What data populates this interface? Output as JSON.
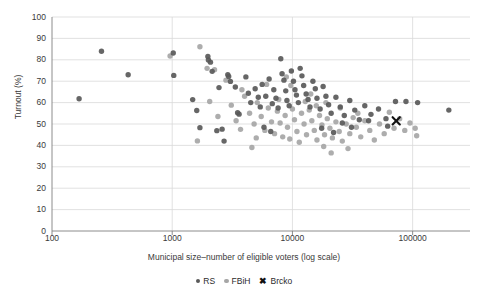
{
  "chart_data": {
    "type": "scatter",
    "title": "",
    "xlabel": "Municipal size–number of eligible voters (log scale)",
    "ylabel": "Turnout (%)",
    "xscale": "log",
    "xlim": [
      100,
      300000
    ],
    "ylim": [
      0,
      100
    ],
    "grid": true,
    "grid_axis": "y",
    "legend_position": "bottom",
    "yticks": [
      0,
      10,
      20,
      30,
      40,
      50,
      60,
      70,
      80,
      90,
      100
    ],
    "xticks": [
      100,
      1000,
      10000,
      100000
    ],
    "xtick_labels": [
      "100",
      "1000",
      "10000",
      "100000"
    ],
    "colors": {
      "RS": "#595959",
      "FBiH": "#a6a6a6",
      "Brcko": "#111111",
      "grid": "#d9d9d9",
      "axis": "#808080",
      "text": "#3a3a3a"
    },
    "series": [
      {
        "name": "RS",
        "marker": "circle",
        "color": "#595959",
        "points": [
          [
            168,
            61.8
          ],
          [
            258,
            84.0
          ],
          [
            430,
            73.0
          ],
          [
            1020,
            83.2
          ],
          [
            1030,
            72.7
          ],
          [
            1480,
            61.4
          ],
          [
            1600,
            56.3
          ],
          [
            1980,
            81.6
          ],
          [
            2000,
            79.9
          ],
          [
            2080,
            78.9
          ],
          [
            2150,
            74.6
          ],
          [
            2450,
            67.0
          ],
          [
            2600,
            47.6
          ],
          [
            2350,
            46.9
          ],
          [
            2900,
            73.0
          ],
          [
            2950,
            72.2
          ],
          [
            3050,
            69.9
          ],
          [
            3350,
            67.3
          ],
          [
            3500,
            55.3
          ],
          [
            3600,
            54.6
          ],
          [
            4100,
            72.0
          ],
          [
            4300,
            64.4
          ],
          [
            4500,
            60.0
          ],
          [
            4900,
            66.5
          ],
          [
            5200,
            62.5
          ],
          [
            5400,
            58.0
          ],
          [
            5600,
            68.5
          ],
          [
            6000,
            63.0
          ],
          [
            6400,
            71.0
          ],
          [
            6800,
            59.5
          ],
          [
            7000,
            66.0
          ],
          [
            7300,
            62.0
          ],
          [
            7600,
            57.5
          ],
          [
            8000,
            80.5
          ],
          [
            8200,
            73.5
          ],
          [
            8500,
            70.5
          ],
          [
            8800,
            65.5
          ],
          [
            9000,
            61.0
          ],
          [
            9400,
            58.5
          ],
          [
            9800,
            74.8
          ],
          [
            10200,
            70.0
          ],
          [
            10500,
            66.0
          ],
          [
            10800,
            63.5
          ],
          [
            11200,
            60.0
          ],
          [
            11600,
            76.0
          ],
          [
            12000,
            72.5
          ],
          [
            12400,
            68.0
          ],
          [
            13000,
            64.0
          ],
          [
            13500,
            61.5
          ],
          [
            14000,
            58.0
          ],
          [
            14800,
            70.0
          ],
          [
            15500,
            66.5
          ],
          [
            16000,
            62.0
          ],
          [
            17000,
            57.0
          ],
          [
            18000,
            67.5
          ],
          [
            19000,
            63.0
          ],
          [
            20000,
            59.0
          ],
          [
            21000,
            55.0
          ],
          [
            23000,
            62.5
          ],
          [
            25000,
            58.0
          ],
          [
            27000,
            54.0
          ],
          [
            30000,
            61.0
          ],
          [
            33000,
            56.5
          ],
          [
            36000,
            52.0
          ],
          [
            40000,
            58.5
          ],
          [
            45000,
            54.5
          ],
          [
            52000,
            57.0
          ],
          [
            60000,
            52.5
          ],
          [
            72000,
            60.5
          ],
          [
            88000,
            60.5
          ],
          [
            110000,
            60.0
          ],
          [
            200000,
            56.5
          ],
          [
            5800,
            48.5
          ],
          [
            6600,
            46.5
          ],
          [
            2700,
            42.0
          ],
          [
            17500,
            48.0
          ],
          [
            22000,
            46.0
          ],
          [
            26000,
            50.5
          ],
          [
            31000,
            48.5
          ],
          [
            43000,
            51.5
          ],
          [
            62000,
            49.0
          ],
          [
            1700,
            48.3
          ]
        ]
      },
      {
        "name": "FBiH",
        "marker": "circle",
        "color": "#a6a6a6",
        "points": [
          [
            960,
            81.8
          ],
          [
            1700,
            86.1
          ],
          [
            1620,
            42.1
          ],
          [
            1950,
            76.0
          ],
          [
            2250,
            75.4
          ],
          [
            3100,
            58.8
          ],
          [
            3400,
            51.5
          ],
          [
            4000,
            63.0
          ],
          [
            4400,
            55.0
          ],
          [
            4800,
            50.0
          ],
          [
            5100,
            60.0
          ],
          [
            5500,
            53.5
          ],
          [
            5900,
            47.0
          ],
          [
            6300,
            57.5
          ],
          [
            6700,
            51.0
          ],
          [
            7100,
            45.5
          ],
          [
            7500,
            56.0
          ],
          [
            7900,
            50.5
          ],
          [
            8300,
            44.0
          ],
          [
            8700,
            54.0
          ],
          [
            9100,
            48.5
          ],
          [
            9500,
            43.0
          ],
          [
            10000,
            57.0
          ],
          [
            10400,
            52.0
          ],
          [
            10900,
            46.5
          ],
          [
            11400,
            41.5
          ],
          [
            11900,
            55.0
          ],
          [
            12500,
            50.0
          ],
          [
            13100,
            45.0
          ],
          [
            13800,
            56.5
          ],
          [
            14500,
            51.5
          ],
          [
            15200,
            47.0
          ],
          [
            16000,
            42.5
          ],
          [
            16800,
            54.0
          ],
          [
            17600,
            49.5
          ],
          [
            18500,
            45.0
          ],
          [
            19500,
            52.5
          ],
          [
            20500,
            48.0
          ],
          [
            21500,
            43.5
          ],
          [
            23000,
            51.0
          ],
          [
            24500,
            46.5
          ],
          [
            26000,
            42.0
          ],
          [
            28000,
            50.0
          ],
          [
            30000,
            45.5
          ],
          [
            32000,
            53.0
          ],
          [
            34000,
            48.5
          ],
          [
            37000,
            44.0
          ],
          [
            40000,
            51.5
          ],
          [
            44000,
            47.0
          ],
          [
            48000,
            42.5
          ],
          [
            53000,
            50.0
          ],
          [
            58000,
            45.5
          ],
          [
            64000,
            55.5
          ],
          [
            70000,
            48.0
          ],
          [
            78000,
            52.5
          ],
          [
            86000,
            47.0
          ],
          [
            95000,
            50.5
          ],
          [
            105000,
            48.0
          ],
          [
            108000,
            44.5
          ],
          [
            3800,
            66.0
          ],
          [
            2800,
            70.5
          ],
          [
            12800,
            60.5
          ],
          [
            14200,
            64.0
          ],
          [
            15800,
            58.5
          ],
          [
            9700,
            68.0
          ],
          [
            8900,
            72.0
          ],
          [
            7700,
            61.5
          ],
          [
            6100,
            68.5
          ],
          [
            19000,
            60.0
          ],
          [
            25000,
            57.5
          ],
          [
            35000,
            55.0
          ],
          [
            21000,
            36.5
          ],
          [
            29000,
            38.5
          ],
          [
            4600,
            39.0
          ],
          [
            2050,
            60.5
          ],
          [
            2400,
            53.5
          ],
          [
            3700,
            47.5
          ],
          [
            5000,
            43.5
          ],
          [
            18200,
            39.5
          ]
        ]
      },
      {
        "name": "Brcko",
        "marker": "x",
        "color": "#111111",
        "points": [
          [
            73000,
            51.5
          ]
        ]
      }
    ]
  },
  "legend": {
    "items": [
      {
        "label": "RS",
        "marker": "circle",
        "color": "#595959"
      },
      {
        "label": "FBiH",
        "marker": "circle",
        "color": "#a6a6a6"
      },
      {
        "label": "Brcko",
        "marker": "x",
        "color": "#111111"
      }
    ]
  }
}
